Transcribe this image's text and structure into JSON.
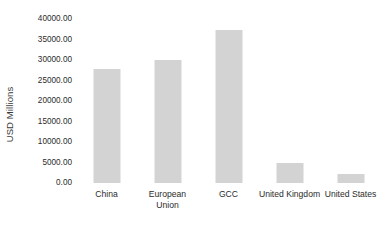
{
  "chart_data": {
    "type": "bar",
    "title": "",
    "subtitle": "",
    "xlabel": "",
    "ylabel": "USD Millions",
    "categories": [
      "China",
      "European Union",
      "GCC",
      "United Kingdom",
      "United States"
    ],
    "values": [
      27800,
      30000,
      37300,
      4900,
      2200
    ],
    "ylim": [
      0,
      40000
    ],
    "ytick_values": [
      0,
      5000,
      10000,
      15000,
      20000,
      25000,
      30000,
      35000,
      40000
    ],
    "ytick_labels": [
      "0.00",
      "5000.00",
      "10000.00",
      "15000.00",
      "20000.00",
      "25000.00",
      "30000.00",
      "35000.00",
      "40000.00"
    ],
    "grid": false,
    "legend": false,
    "legend_position": "none",
    "bar_color": "#d3d3d3",
    "background_color": "#ffffff",
    "text_color": "#2b2b2b"
  }
}
